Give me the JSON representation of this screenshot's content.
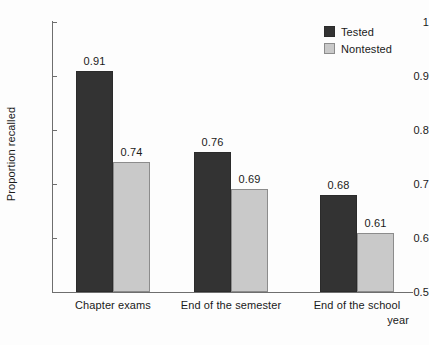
{
  "chart_data": {
    "type": "bar",
    "title": "",
    "subtitle": "",
    "xlabel": "",
    "ylabel": "Proportion recalled",
    "categories": [
      "Chapter exams",
      "End of the semester",
      "End of the school year"
    ],
    "category_lines": [
      [
        "Chapter exams"
      ],
      [
        "End of the semester"
      ],
      [
        "End of the school",
        "year"
      ]
    ],
    "series": [
      {
        "name": "Tested",
        "color": "#333333",
        "values": [
          0.91,
          0.76,
          0.68
        ],
        "labels": [
          "0.91",
          "0.76",
          "0.68"
        ]
      },
      {
        "name": "Nontested",
        "color": "#c9c9c9",
        "values": [
          0.74,
          0.69,
          0.61
        ],
        "labels": [
          "0.74",
          "0.69",
          "0.61"
        ]
      }
    ],
    "ylim": [
      0.5,
      1
    ],
    "yticks": [
      0.5,
      0.6,
      0.7,
      0.8,
      0.9,
      1
    ],
    "ytick_labels": [
      "0.5",
      "0.6",
      "0.7",
      "0.8",
      "0.9",
      "1"
    ],
    "grid": false,
    "legend_position": "top-right",
    "legend_entries": [
      "Tested",
      "Nontested"
    ]
  },
  "axis": {
    "y_title": "Proportion recalled",
    "ticks": [
      {
        "value": 1,
        "label": "1"
      },
      {
        "value": 0.9,
        "label": "0.9"
      },
      {
        "value": 0.8,
        "label": "0.8"
      },
      {
        "value": 0.7,
        "label": "0.7"
      },
      {
        "value": 0.6,
        "label": "0.6"
      },
      {
        "value": 0.5,
        "label": "0.5"
      }
    ]
  },
  "legend": {
    "items": [
      {
        "label": "Tested",
        "color": "#333333"
      },
      {
        "label": "Nontested",
        "color": "#c9c9c9"
      }
    ]
  },
  "groups": [
    {
      "label_line1": "Chapter exams",
      "label_line2": "",
      "tested_label": "0.91",
      "nontested_label": "0.74"
    },
    {
      "label_line1": "End of the semester",
      "label_line2": "",
      "tested_label": "0.76",
      "nontested_label": "0.69"
    },
    {
      "label_line1": "End of the school",
      "label_line2": "year",
      "tested_label": "0.68",
      "nontested_label": "0.61"
    }
  ]
}
